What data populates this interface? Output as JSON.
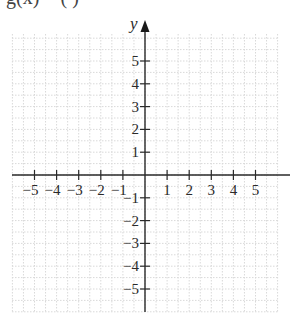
{
  "header": {
    "cropped_title": "g(x) = (          )"
  },
  "chart_data": {
    "type": "line",
    "xlabel": "",
    "ylabel": "y",
    "xlim": [
      -6,
      6
    ],
    "ylim": [
      -6,
      6
    ],
    "grid": true,
    "grid_style": "dotted",
    "x_ticks": [
      -5,
      -4,
      -3,
      -2,
      -1,
      1,
      2,
      3,
      4,
      5
    ],
    "y_ticks": [
      5,
      4,
      3,
      2,
      1,
      -1,
      -2,
      -3,
      -4,
      -5
    ],
    "x_tick_labels": [
      "−5",
      "−4",
      "−3",
      "−2",
      "−1",
      "1",
      "2",
      "3",
      "4",
      "5"
    ],
    "y_tick_labels": [
      "5",
      "4",
      "3",
      "2",
      "1",
      "−1",
      "−2",
      "−3",
      "−4",
      "−5"
    ],
    "series": [],
    "legend": null
  },
  "colors": {
    "axis": "#2a2a2a",
    "grid": "#d9d9d9",
    "background": "#ffffff"
  }
}
